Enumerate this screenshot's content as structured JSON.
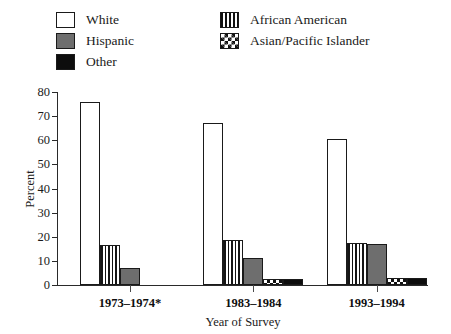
{
  "chart_data": {
    "type": "bar",
    "title": "",
    "xlabel": "Year of Survey",
    "ylabel": "Percent",
    "ylim": [
      0,
      80
    ],
    "yticks": [
      0,
      10,
      20,
      30,
      40,
      50,
      60,
      70,
      80
    ],
    "grid": false,
    "legend_position": "top",
    "categories": [
      "1973–1974*",
      "1983–1984",
      "1993–1994"
    ],
    "series": [
      {
        "name": "White",
        "fill": "solid-white",
        "values": [
          76,
          67,
          60.5
        ]
      },
      {
        "name": "African American",
        "fill": "vertical-stripes",
        "values": [
          16.5,
          18.7,
          17.5
        ]
      },
      {
        "name": "Hispanic",
        "fill": "solid-gray",
        "values": [
          7,
          11.2,
          17
        ]
      },
      {
        "name": "Asian/Pacific Islander",
        "fill": "checkerboard",
        "values": [
          0,
          2.5,
          3
        ]
      },
      {
        "name": "Other",
        "fill": "solid-black",
        "values": [
          0,
          2.5,
          3
        ]
      }
    ]
  },
  "legend": {
    "left_column": [
      {
        "label": "White",
        "swatch": "white-swatch"
      },
      {
        "label": "Hispanic",
        "swatch": "hispanic-swatch"
      },
      {
        "label": "Other",
        "swatch": "other-swatch"
      }
    ],
    "right_column": [
      {
        "label": "African American",
        "swatch": "african-american-swatch"
      },
      {
        "label": "Asian/Pacific Islander",
        "swatch": "asian-pacific-islander-swatch"
      }
    ]
  },
  "axes": {
    "y_title": "Percent",
    "x_title": "Year of Survey",
    "y_tick_labels": [
      "80",
      "70",
      "60",
      "50",
      "40",
      "30",
      "20",
      "10",
      "0"
    ],
    "x_tick_labels": [
      "1973–1974*",
      "1983–1984",
      "1993–1994"
    ]
  },
  "colors": {
    "axis": "#2a2a2a",
    "bar_outline": "#1a1a1a",
    "gray_fill": "#6e6e6e",
    "black_fill": "#0d0d0d",
    "white_fill": "#ffffff"
  }
}
